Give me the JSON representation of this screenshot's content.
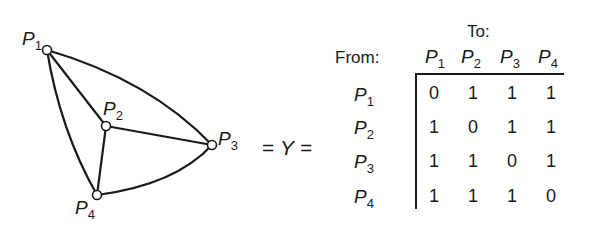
{
  "graph": {
    "nodes": [
      {
        "id": "P1",
        "label": "P",
        "sub": "1"
      },
      {
        "id": "P2",
        "label": "P",
        "sub": "2"
      },
      {
        "id": "P3",
        "label": "P",
        "sub": "3"
      },
      {
        "id": "P4",
        "label": "P",
        "sub": "4"
      }
    ],
    "edges": [
      [
        "P1",
        "P2"
      ],
      [
        "P1",
        "P3"
      ],
      [
        "P1",
        "P4"
      ],
      [
        "P2",
        "P3"
      ],
      [
        "P2",
        "P4"
      ],
      [
        "P3",
        "P4"
      ]
    ]
  },
  "equation": {
    "left": "=",
    "symbol": "Y",
    "right": "="
  },
  "matrix": {
    "to_label": "To:",
    "from_label": "From:",
    "columns": [
      {
        "label": "P",
        "sub": "1"
      },
      {
        "label": "P",
        "sub": "2"
      },
      {
        "label": "P",
        "sub": "3"
      },
      {
        "label": "P",
        "sub": "4"
      }
    ],
    "rows": [
      {
        "label": "P",
        "sub": "1",
        "values": [
          "0",
          "1",
          "1",
          "1"
        ]
      },
      {
        "label": "P",
        "sub": "2",
        "values": [
          "1",
          "0",
          "1",
          "1"
        ]
      },
      {
        "label": "P",
        "sub": "3",
        "values": [
          "1",
          "1",
          "0",
          "1"
        ]
      },
      {
        "label": "P",
        "sub": "4",
        "values": [
          "1",
          "1",
          "1",
          "0"
        ]
      }
    ]
  }
}
